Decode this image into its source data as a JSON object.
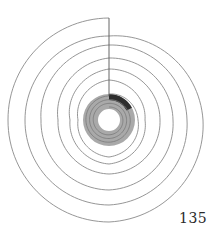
{
  "page": {
    "page_number": "135"
  },
  "diagram": {
    "type": "spiral",
    "center": [
      109,
      120
    ],
    "colors": {
      "line": "#8a8a8a",
      "axis": "#555555",
      "ring_fill": "#a9a9a9",
      "highlight": "#2e2e2e",
      "background": "#ffffff"
    },
    "spiral_radii_by_quarter_turn": [
      102,
      101,
      102,
      94,
      84,
      84,
      85,
      78,
      75,
      68,
      70,
      64,
      62,
      51,
      54,
      51,
      51,
      39,
      44,
      36,
      40,
      31,
      37,
      29,
      26
    ],
    "ring": {
      "inner_radius": 11,
      "outer_radius": 26
    },
    "highlight_arc": {
      "start_deg": 0,
      "end_deg": 62,
      "inner_radius": 20,
      "outer_radius": 26
    },
    "axis_line": {
      "x": 109,
      "y1": 18,
      "y2": 96
    }
  }
}
